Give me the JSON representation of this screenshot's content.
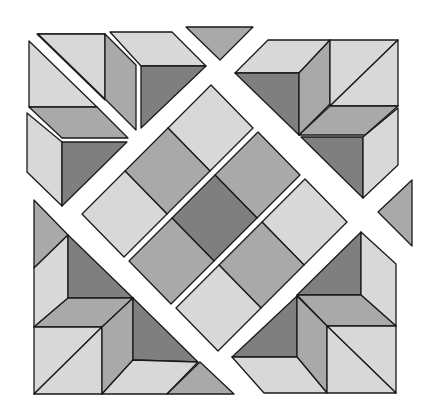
{
  "figure": {
    "width": 435,
    "height": 420
  },
  "palette": {
    "light": "#d8d8d8",
    "medium": "#a9a9a9",
    "dark": "#7f7f7f",
    "outline": "#1a1a1a",
    "background": "#ffffff"
  },
  "center_grid": {
    "origin": [
      211,
      85
    ],
    "cell_se": [
      42,
      43
    ],
    "cell_sw": [
      -43,
      43
    ],
    "strip_offset": [
      47,
      47
    ],
    "strips": [
      [
        "light",
        "medium",
        "light"
      ],
      [
        "medium",
        "dark",
        "medium"
      ],
      [
        "light",
        "medium",
        "light"
      ]
    ]
  },
  "pieces": [
    {
      "name": "top-left-cube-top-face",
      "shade": "light",
      "points": [
        [
          37,
          34
        ],
        [
          105,
          34
        ],
        [
          105,
          100
        ],
        [
          37,
          34
        ]
      ]
    },
    {
      "name": "top-left-cube-upper-triangle",
      "shade": "light",
      "points": [
        [
          38,
          34
        ],
        [
          105,
          34
        ],
        [
          105,
          99
        ]
      ]
    },
    {
      "name": "top-left-cube-left-triangle",
      "shade": "light",
      "points": [
        [
          29,
          41
        ],
        [
          29,
          107
        ],
        [
          97,
          107
        ]
      ]
    },
    {
      "name": "top-left-cube-right-face",
      "shade": "medium",
      "points": [
        [
          105,
          34
        ],
        [
          136,
          65
        ],
        [
          136,
          130
        ],
        [
          105,
          99
        ]
      ]
    },
    {
      "name": "top-left-cube-bottom-face",
      "shade": "medium",
      "points": [
        [
          29,
          107
        ],
        [
          97,
          107
        ],
        [
          128,
          138
        ],
        [
          62,
          138
        ]
      ]
    },
    {
      "name": "top-second-cube-top-face",
      "shade": "light",
      "points": [
        [
          110,
          32
        ],
        [
          172,
          32
        ],
        [
          206,
          66
        ],
        [
          141,
          66
        ]
      ]
    },
    {
      "name": "top-second-cube-front-face",
      "shade": "dark",
      "points": [
        [
          141,
          66
        ],
        [
          206,
          66
        ],
        [
          141,
          128
        ]
      ]
    },
    {
      "name": "top-center-triangle",
      "shade": "medium",
      "points": [
        [
          186,
          27
        ],
        [
          253,
          27
        ],
        [
          220,
          60
        ]
      ]
    },
    {
      "name": "left-cube-left-face",
      "shade": "light",
      "points": [
        [
          27,
          113
        ],
        [
          62,
          142
        ],
        [
          62,
          206
        ],
        [
          27,
          172
        ]
      ]
    },
    {
      "name": "left-cube-front-face",
      "shade": "dark",
      "points": [
        [
          62,
          142
        ],
        [
          127,
          142
        ],
        [
          62,
          206
        ]
      ]
    },
    {
      "name": "top-right-left-top-face",
      "shade": "light",
      "points": [
        [
          268,
          40
        ],
        [
          330,
          40
        ],
        [
          299,
          73
        ],
        [
          235,
          73
        ]
      ]
    },
    {
      "name": "top-right-left-front-face",
      "shade": "dark",
      "points": [
        [
          235,
          73
        ],
        [
          299,
          73
        ],
        [
          299,
          135
        ]
      ]
    },
    {
      "name": "top-right-left-side-face",
      "shade": "medium",
      "points": [
        [
          299,
          73
        ],
        [
          330,
          40
        ],
        [
          330,
          104
        ],
        [
          299,
          135
        ]
      ]
    },
    {
      "name": "top-right-square-upper",
      "shade": "light",
      "points": [
        [
          330,
          40
        ],
        [
          398,
          40
        ],
        [
          330,
          106
        ]
      ]
    },
    {
      "name": "top-right-square-lower",
      "shade": "light",
      "points": [
        [
          398,
          40
        ],
        [
          398,
          106
        ],
        [
          330,
          106
        ]
      ]
    },
    {
      "name": "top-right-bottom-top-face",
      "shade": "medium",
      "points": [
        [
          330,
          106
        ],
        [
          398,
          106
        ],
        [
          365,
          135
        ],
        [
          299,
          135
        ]
      ]
    },
    {
      "name": "top-right-bottom-front-face",
      "shade": "dark",
      "points": [
        [
          301,
          137
        ],
        [
          363,
          137
        ],
        [
          363,
          198
        ]
      ]
    },
    {
      "name": "top-right-bottom-side-face",
      "shade": "light",
      "points": [
        [
          363,
          137
        ],
        [
          398,
          108
        ],
        [
          398,
          165
        ],
        [
          363,
          198
        ]
      ]
    },
    {
      "name": "right-triangle",
      "shade": "medium",
      "points": [
        [
          412,
          180
        ],
        [
          412,
          246
        ],
        [
          378,
          212
        ]
      ]
    },
    {
      "name": "bottom-left-top-triangle",
      "shade": "medium",
      "points": [
        [
          34,
          200
        ],
        [
          68,
          235
        ],
        [
          34,
          268
        ]
      ]
    },
    {
      "name": "bottom-left-left-face",
      "shade": "light",
      "points": [
        [
          34,
          268
        ],
        [
          68,
          235
        ],
        [
          68,
          298
        ],
        [
          34,
          327
        ]
      ]
    },
    {
      "name": "bottom-left-inner-dark",
      "shade": "dark",
      "points": [
        [
          68,
          235
        ],
        [
          133,
          298
        ],
        [
          68,
          298
        ]
      ]
    },
    {
      "name": "bottom-left-middle-top-face",
      "shade": "medium",
      "points": [
        [
          68,
          298
        ],
        [
          133,
          298
        ],
        [
          102,
          327
        ],
        [
          34,
          327
        ]
      ]
    },
    {
      "name": "bottom-left-square-upper",
      "shade": "light",
      "points": [
        [
          34,
          327
        ],
        [
          102,
          327
        ],
        [
          34,
          394
        ]
      ]
    },
    {
      "name": "bottom-left-square-lower",
      "shade": "light",
      "points": [
        [
          102,
          327
        ],
        [
          102,
          394
        ],
        [
          34,
          394
        ]
      ]
    },
    {
      "name": "bottom-left-side-face",
      "shade": "medium",
      "points": [
        [
          102,
          327
        ],
        [
          133,
          298
        ],
        [
          133,
          360
        ],
        [
          102,
          394
        ]
      ]
    },
    {
      "name": "bottom-left-lower-dark",
      "shade": "dark",
      "points": [
        [
          133,
          298
        ],
        [
          198,
          362
        ],
        [
          133,
          360
        ]
      ]
    },
    {
      "name": "bottom-left-bottom-face",
      "shade": "light",
      "points": [
        [
          133,
          360
        ],
        [
          198,
          362
        ],
        [
          167,
          394
        ],
        [
          102,
          394
        ]
      ]
    },
    {
      "name": "bottom-center-triangle",
      "shade": "medium",
      "points": [
        [
          200,
          362
        ],
        [
          234,
          394
        ],
        [
          167,
          394
        ]
      ]
    },
    {
      "name": "bottom-right-upper-dark",
      "shade": "dark",
      "points": [
        [
          361,
          232
        ],
        [
          361,
          295
        ],
        [
          297,
          295
        ]
      ]
    },
    {
      "name": "bottom-right-right-face",
      "shade": "light",
      "points": [
        [
          361,
          232
        ],
        [
          396,
          264
        ],
        [
          396,
          326
        ],
        [
          361,
          295
        ]
      ]
    },
    {
      "name": "bottom-right-middle-top-face",
      "shade": "medium",
      "points": [
        [
          297,
          295
        ],
        [
          361,
          295
        ],
        [
          396,
          326
        ],
        [
          327,
          326
        ]
      ]
    },
    {
      "name": "bottom-right-left-dark",
      "shade": "dark",
      "points": [
        [
          297,
          296
        ],
        [
          297,
          357
        ],
        [
          232,
          357
        ]
      ]
    },
    {
      "name": "bottom-right-side-face",
      "shade": "medium",
      "points": [
        [
          297,
          296
        ],
        [
          327,
          326
        ],
        [
          327,
          393
        ],
        [
          297,
          357
        ]
      ]
    },
    {
      "name": "bottom-right-bottom-face",
      "shade": "light",
      "points": [
        [
          232,
          357
        ],
        [
          297,
          357
        ],
        [
          327,
          393
        ],
        [
          264,
          393
        ]
      ]
    },
    {
      "name": "bottom-right-square-upper",
      "shade": "light",
      "points": [
        [
          327,
          326
        ],
        [
          396,
          326
        ],
        [
          396,
          393
        ]
      ]
    },
    {
      "name": "bottom-right-square-lower",
      "shade": "light",
      "points": [
        [
          327,
          326
        ],
        [
          396,
          393
        ],
        [
          327,
          393
        ]
      ]
    }
  ]
}
